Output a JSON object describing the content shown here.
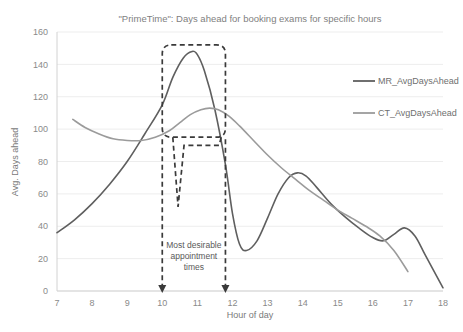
{
  "chart_data": {
    "type": "line",
    "title": "\"PrimeTime\": Days ahead for booking exams for specific hours",
    "xlabel": "Hour of day",
    "ylabel": "Avg. Days ahead",
    "xlim": [
      7,
      18
    ],
    "ylim": [
      0,
      160
    ],
    "xticks": [
      7,
      8,
      9,
      10,
      11,
      12,
      13,
      14,
      15,
      16,
      17,
      18
    ],
    "yticks": [
      0,
      20,
      40,
      60,
      80,
      100,
      120,
      140,
      160
    ],
    "grid": "horizontal",
    "legend_position": "top-right",
    "series": [
      {
        "name": "MR_AvgDaysAhead",
        "color": "#5f5f5f",
        "points": [
          [
            7.0,
            36
          ],
          [
            7.5,
            44
          ],
          [
            8.0,
            54
          ],
          [
            8.5,
            66
          ],
          [
            9.0,
            80
          ],
          [
            9.5,
            97
          ],
          [
            10.0,
            115
          ],
          [
            10.3,
            132
          ],
          [
            10.6,
            144
          ],
          [
            10.85,
            148
          ],
          [
            11.0,
            146
          ],
          [
            11.2,
            136
          ],
          [
            11.5,
            112
          ],
          [
            11.8,
            78
          ],
          [
            12.0,
            48
          ],
          [
            12.2,
            29
          ],
          [
            12.4,
            25
          ],
          [
            12.7,
            31
          ],
          [
            13.0,
            45
          ],
          [
            13.3,
            60
          ],
          [
            13.6,
            70
          ],
          [
            13.85,
            73
          ],
          [
            14.1,
            71
          ],
          [
            14.4,
            64
          ],
          [
            14.8,
            54
          ],
          [
            15.2,
            46
          ],
          [
            15.6,
            39
          ],
          [
            16.0,
            33
          ],
          [
            16.3,
            31
          ],
          [
            16.6,
            35
          ],
          [
            16.9,
            39
          ],
          [
            17.2,
            34
          ],
          [
            17.5,
            22
          ],
          [
            18.0,
            2
          ]
        ]
      },
      {
        "name": "CT_AvgDaysAhead",
        "color": "#9b9b9b",
        "points": [
          [
            7.45,
            106
          ],
          [
            7.8,
            101
          ],
          [
            8.2,
            97
          ],
          [
            8.6,
            94
          ],
          [
            9.0,
            93
          ],
          [
            9.4,
            93
          ],
          [
            9.8,
            95
          ],
          [
            10.2,
            99
          ],
          [
            10.5,
            104
          ],
          [
            10.8,
            109
          ],
          [
            11.1,
            112
          ],
          [
            11.35,
            113
          ],
          [
            11.6,
            112
          ],
          [
            11.9,
            108
          ],
          [
            12.2,
            102
          ],
          [
            12.6,
            93
          ],
          [
            13.0,
            84
          ],
          [
            13.4,
            76
          ],
          [
            13.8,
            69
          ],
          [
            14.2,
            62
          ],
          [
            14.6,
            56
          ],
          [
            15.0,
            50
          ],
          [
            15.4,
            45
          ],
          [
            15.8,
            40
          ],
          [
            16.2,
            34
          ],
          [
            16.6,
            25
          ],
          [
            17.0,
            12
          ]
        ]
      }
    ],
    "annotations": [
      {
        "name": "most-desirable-window",
        "text_lines": [
          "Most desirable",
          "appointment",
          "times"
        ],
        "highlight_x_range": [
          10.0,
          11.8
        ],
        "highlight_y_range": [
          95,
          152
        ],
        "arrow_x_positions": [
          10.0,
          11.8
        ]
      }
    ]
  },
  "legend": {
    "items": [
      {
        "label": "MR_AvgDaysAhead"
      },
      {
        "label": "CT_AvgDaysAhead"
      }
    ]
  },
  "annotation_text": {
    "line1": "Most desirable",
    "line2": "appointment",
    "line3": "times"
  }
}
